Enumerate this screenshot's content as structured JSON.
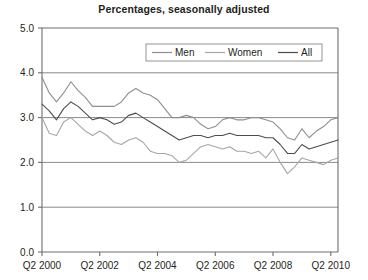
{
  "chart_data": {
    "type": "line",
    "title": "Percentages, seasonally adjusted",
    "xlabel": "",
    "ylabel": "",
    "ylim": [
      0.0,
      5.0
    ],
    "ytick_labels": [
      "0.0",
      "1.0",
      "2.0",
      "3.0",
      "4.0",
      "5.0"
    ],
    "ytick_values": [
      0.0,
      1.0,
      2.0,
      3.0,
      4.0,
      5.0
    ],
    "grid": true,
    "grid_axis": "y",
    "legend_position": "top-center",
    "x_start_label": "Q2 2000",
    "xtick_labels": [
      "Q2 2000",
      "Q2 2002",
      "Q2 2004",
      "Q2 2006",
      "Q2 2008",
      "Q2 2010"
    ],
    "xtick_indices": [
      0,
      8,
      16,
      24,
      32,
      40
    ],
    "x_count": 42,
    "series": [
      {
        "name": "Men",
        "color": "#8f8f8f",
        "values": [
          3.9,
          3.55,
          3.35,
          3.55,
          3.8,
          3.6,
          3.45,
          3.25,
          3.25,
          3.25,
          3.25,
          3.35,
          3.55,
          3.65,
          3.55,
          3.5,
          3.4,
          3.2,
          3.0,
          3.0,
          3.05,
          3.0,
          2.85,
          2.75,
          2.8,
          2.95,
          3.0,
          2.95,
          2.95,
          3.0,
          3.0,
          2.95,
          2.9,
          2.75,
          2.55,
          2.5,
          2.75,
          2.55,
          2.7,
          2.8,
          2.95,
          3.0
        ]
      },
      {
        "name": "Women",
        "color": "#a6a6a6",
        "values": [
          3.0,
          2.65,
          2.6,
          2.9,
          3.0,
          2.85,
          2.7,
          2.6,
          2.7,
          2.6,
          2.45,
          2.4,
          2.5,
          2.55,
          2.45,
          2.25,
          2.2,
          2.2,
          2.15,
          2.0,
          2.05,
          2.2,
          2.35,
          2.4,
          2.35,
          2.3,
          2.35,
          2.25,
          2.25,
          2.2,
          2.25,
          2.1,
          2.3,
          2.0,
          1.75,
          1.9,
          2.1,
          2.05,
          2.0,
          1.95,
          2.05,
          2.1
        ]
      },
      {
        "name": "All",
        "color": "#4d4d4d",
        "values": [
          3.3,
          3.15,
          2.95,
          3.2,
          3.35,
          3.25,
          3.1,
          2.95,
          3.0,
          2.95,
          2.85,
          2.9,
          3.05,
          3.1,
          3.0,
          2.9,
          2.8,
          2.7,
          2.6,
          2.5,
          2.55,
          2.6,
          2.6,
          2.55,
          2.6,
          2.6,
          2.65,
          2.6,
          2.6,
          2.6,
          2.6,
          2.55,
          2.55,
          2.4,
          2.2,
          2.2,
          2.4,
          2.3,
          2.35,
          2.4,
          2.45,
          2.5
        ]
      }
    ]
  },
  "legend": {
    "items": [
      {
        "label": "Men"
      },
      {
        "label": "Women"
      },
      {
        "label": "All"
      }
    ]
  }
}
